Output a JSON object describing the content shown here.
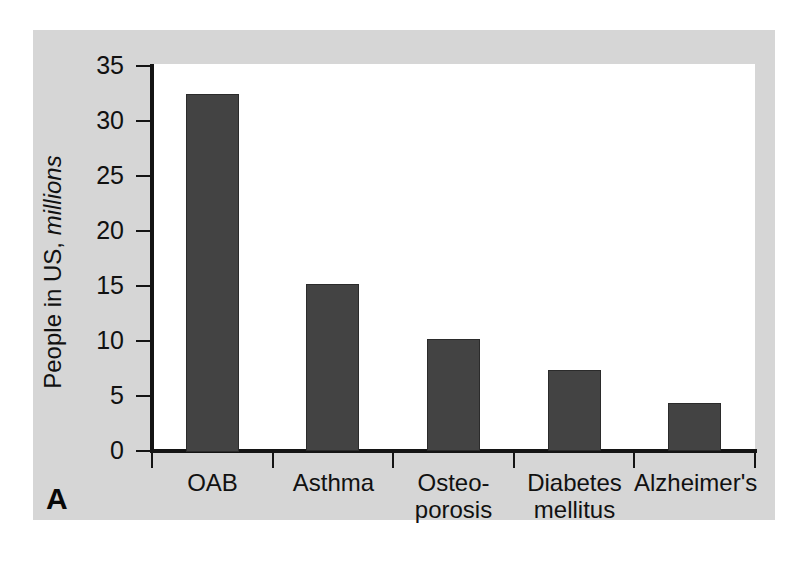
{
  "chart_data": {
    "type": "bar",
    "title": "",
    "subtitle": "",
    "xlabel": "",
    "ylabel": "People in US, millions",
    "ylabel_plain": "People in US,",
    "ylabel_italic": "millions",
    "categories": [
      "OAB",
      "Asthma",
      "Osteo-porosis",
      "Diabetes mellitus",
      "Alzheimer's"
    ],
    "category_lines": [
      [
        "OAB"
      ],
      [
        "Asthma"
      ],
      [
        "Osteo-",
        "porosis"
      ],
      [
        "Diabetes",
        "mellitus"
      ],
      [
        "Alzheimer's"
      ]
    ],
    "values": [
      32.5,
      15.2,
      10.2,
      7.4,
      4.4
    ],
    "ylim": [
      0,
      35
    ],
    "yticks": [
      0,
      5,
      10,
      15,
      20,
      25,
      30,
      35
    ],
    "ytick_labels": [
      "0",
      "5",
      "10",
      "15",
      "20",
      "25",
      "30",
      "35"
    ],
    "grid": false,
    "legend": false,
    "legend_position": "none",
    "bar_color": "#434343",
    "bar_edge_color": "#2b2b2b",
    "plot_background": "#ffffff",
    "panel_background": "#d6d6d6",
    "axis_color": "#141414"
  },
  "panel": {
    "letter": "A"
  }
}
